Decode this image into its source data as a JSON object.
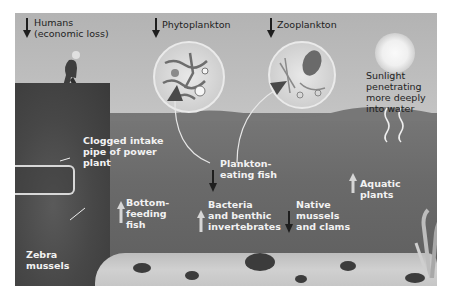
{
  "diagram": {
    "type": "ecological impact illustration",
    "legend": {
      "down_arrow": "decrease",
      "up_arrow": "increase"
    },
    "labels": {
      "humans": "Humans\n(economic loss)",
      "phytoplankton": "Phytoplankton",
      "zooplankton": "Zooplankton",
      "sunlight": "Sunlight\npenetrating\nmore deeply\ninto water",
      "clogged_pipe": "Clogged intake\npipe of power\nplant",
      "plankton_fish": "Plankton-\neating fish",
      "aquatic_plants": "Aquatic plants",
      "bottom_fish": "Bottom-\nfeeding\nfish",
      "bacteria": "Bacteria\nand benthic\ninvertebrates",
      "native_mussels": "Native\nmussels\nand clams",
      "zebra_mussels": "Zebra\nmussels"
    },
    "effects": [
      {
        "organism": "Humans (economic loss)",
        "direction": "down"
      },
      {
        "organism": "Phytoplankton",
        "direction": "down"
      },
      {
        "organism": "Zooplankton",
        "direction": "down"
      },
      {
        "organism": "Plankton-eating fish",
        "direction": "down"
      },
      {
        "organism": "Native mussels and clams",
        "direction": "down"
      },
      {
        "organism": "Bottom-feeding fish",
        "direction": "up"
      },
      {
        "organism": "Bacteria and benthic invertebrates",
        "direction": "up"
      },
      {
        "organism": "Aquatic plants",
        "direction": "up"
      }
    ],
    "colors": {
      "sky": "#b9b9b9",
      "water": "#6a6a6a",
      "down_arrow": "#1e1e1e",
      "up_arrow": "#d6d6d6",
      "label_dark": "#1e1e1e",
      "label_light": "#f2f2f2"
    }
  }
}
